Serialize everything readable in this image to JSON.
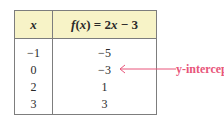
{
  "table": {
    "headers": {
      "x": "x",
      "f_prefix": "f",
      "f_paren_open": "(",
      "f_var": "x",
      "f_paren_close": ")",
      "f_rhs": " = 2",
      "f_rhs_var": "x",
      "f_rhs_tail": " − 3"
    },
    "rows": [
      {
        "x": "−1",
        "fx": "−5"
      },
      {
        "x": "0",
        "fx": "−3"
      },
      {
        "x": "2",
        "fx": "1"
      },
      {
        "x": "3",
        "fx": "3"
      }
    ]
  },
  "annotation": {
    "label": "y-intercept",
    "color": "#e8557a",
    "points_to_row": 1
  },
  "colors": {
    "header_bg": "#f7f3c7",
    "border": "#7d7d7d"
  }
}
